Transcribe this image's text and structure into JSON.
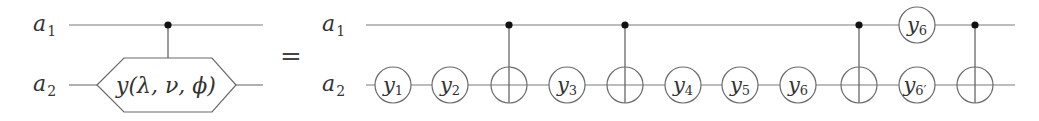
{
  "diagram": {
    "type": "quantum-circuit-identity",
    "equals_symbol": "=",
    "colors": {
      "wire": "#7a7a7a",
      "control_dot": "#111111",
      "text": "#333333",
      "background": "#ffffff"
    },
    "left": {
      "qubits": [
        {
          "name": "a",
          "sub": "1"
        },
        {
          "name": "a",
          "sub": "2"
        }
      ],
      "gate": {
        "kind": "controlled-hexagon",
        "control_qubit": "a1",
        "target_qubit": "a2",
        "label": "y(λ, ν, ϕ)"
      }
    },
    "right": {
      "qubits": [
        {
          "name": "a",
          "sub": "1"
        },
        {
          "name": "a",
          "sub": "2"
        }
      ],
      "gates": [
        {
          "kind": "single",
          "qubit": "a2",
          "name": "y",
          "sub": "1"
        },
        {
          "kind": "single",
          "qubit": "a2",
          "name": "y",
          "sub": "2"
        },
        {
          "kind": "cnot",
          "control": "a1",
          "target": "a2"
        },
        {
          "kind": "single",
          "qubit": "a2",
          "name": "y",
          "sub": "3"
        },
        {
          "kind": "cnot",
          "control": "a1",
          "target": "a2"
        },
        {
          "kind": "single",
          "qubit": "a2",
          "name": "y",
          "sub": "4"
        },
        {
          "kind": "single",
          "qubit": "a2",
          "name": "y",
          "sub": "5"
        },
        {
          "kind": "single",
          "qubit": "a2",
          "name": "y",
          "sub": "6"
        },
        {
          "kind": "cnot",
          "control": "a1",
          "target": "a2"
        },
        {
          "kind": "single",
          "qubit": "a1",
          "name": "y",
          "sub": "6"
        },
        {
          "kind": "single",
          "qubit": "a2",
          "name": "y",
          "sub": "6′"
        },
        {
          "kind": "cnot",
          "control": "a1",
          "target": "a2"
        }
      ]
    }
  },
  "labels": {
    "left_a1": {
      "main": "a",
      "sub": "1"
    },
    "left_a2": {
      "main": "a",
      "sub": "2"
    },
    "right_a1": {
      "main": "a",
      "sub": "1"
    },
    "right_a2": {
      "main": "a",
      "sub": "2"
    },
    "hex_gate": "y(λ, ν, ϕ)",
    "equals": "=",
    "g_y1": {
      "main": "y",
      "sub": "1"
    },
    "g_y2": {
      "main": "y",
      "sub": "2"
    },
    "g_y3": {
      "main": "y",
      "sub": "3"
    },
    "g_y4": {
      "main": "y",
      "sub": "4"
    },
    "g_y5": {
      "main": "y",
      "sub": "5"
    },
    "g_y6": {
      "main": "y",
      "sub": "6"
    },
    "g_y6_top": {
      "main": "y",
      "sub": "6"
    },
    "g_y6p": {
      "main": "y",
      "sub": "6′"
    }
  }
}
